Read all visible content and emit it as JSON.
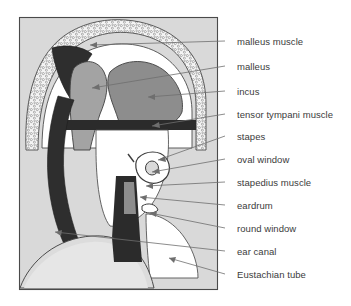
{
  "figure": {
    "frame": {
      "x": 19,
      "y": 17,
      "width": 199,
      "height": 273
    },
    "colors": {
      "background": "#ffffff",
      "frame_border": "#4a4a4a",
      "cavity_fill": "#d9d9d9",
      "bone_stipple": "#f2f2f2",
      "malleus_gray": "#9d9d9d",
      "incus_gray": "#8a8a8a",
      "dark_structure": "#2e2e2e",
      "white_space": "#ffffff",
      "leader_line": "#6e6e6e",
      "label_text": "#3b3b3b"
    },
    "labels": [
      {
        "id": "malleus-muscle",
        "text": "malleus muscle",
        "x": 237,
        "y": 37,
        "leader_x1": 225,
        "leader_y1": 41,
        "leader_x2": 90,
        "leader_y2": 45,
        "arrow": true
      },
      {
        "id": "malleus",
        "text": "malleus",
        "x": 237,
        "y": 62,
        "leader_x1": 225,
        "leader_y1": 66,
        "leader_x2": 92,
        "leader_y2": 88,
        "arrow": true
      },
      {
        "id": "incus",
        "text": "incus",
        "x": 237,
        "y": 87,
        "leader_x1": 225,
        "leader_y1": 91,
        "leader_x2": 148,
        "leader_y2": 97,
        "arrow": true
      },
      {
        "id": "tensor-tympani-muscle",
        "text": "tensor tympani muscle",
        "x": 237,
        "y": 110,
        "leader_x1": 225,
        "leader_y1": 114,
        "leader_x2": 152,
        "leader_y2": 126,
        "arrow": true
      },
      {
        "id": "stapes",
        "text": "stapes",
        "x": 237,
        "y": 132,
        "leader_x1": 225,
        "leader_y1": 136,
        "leader_x2": 158,
        "leader_y2": 160,
        "arrow": true
      },
      {
        "id": "oval-window",
        "text": "oval window",
        "x": 237,
        "y": 155,
        "leader_x1": 225,
        "leader_y1": 159,
        "leader_x2": 152,
        "leader_y2": 172,
        "arrow": true
      },
      {
        "id": "stapedius-muscle",
        "text": "stapedius muscle",
        "x": 237,
        "y": 178,
        "leader_x1": 225,
        "leader_y1": 182,
        "leader_x2": 146,
        "leader_y2": 186,
        "arrow": true
      },
      {
        "id": "eardrum",
        "text": "eardrum",
        "x": 237,
        "y": 201,
        "leader_x1": 225,
        "leader_y1": 205,
        "leader_x2": 140,
        "leader_y2": 197,
        "arrow": true
      },
      {
        "id": "round-window",
        "text": "round window",
        "x": 237,
        "y": 224,
        "leader_x1": 225,
        "leader_y1": 228,
        "leader_x2": 150,
        "leader_y2": 213,
        "arrow": true
      },
      {
        "id": "ear-canal",
        "text": "ear canal",
        "x": 237,
        "y": 247,
        "leader_x1": 225,
        "leader_y1": 251,
        "leader_x2": 55,
        "leader_y2": 232,
        "arrow": true
      },
      {
        "id": "eustachian-tube",
        "text": "Eustachian tube",
        "x": 237,
        "y": 270,
        "leader_x1": 225,
        "leader_y1": 274,
        "leader_x2": 169,
        "leader_y2": 258,
        "arrow": true
      }
    ],
    "structures": [
      {
        "id": "tympanic-cavity",
        "name": "tympanic cavity"
      },
      {
        "id": "stippled-bone",
        "name": "temporal bone (stippled)"
      },
      {
        "id": "malleus-body",
        "name": "malleus"
      },
      {
        "id": "incus-body",
        "name": "incus"
      },
      {
        "id": "tensor-bar",
        "name": "tensor tympani muscle"
      },
      {
        "id": "stapes-ring",
        "name": "stapes"
      },
      {
        "id": "ear-canal-shaft",
        "name": "ear canal"
      },
      {
        "id": "eustachian-dome",
        "name": "Eustachian tube"
      }
    ]
  }
}
